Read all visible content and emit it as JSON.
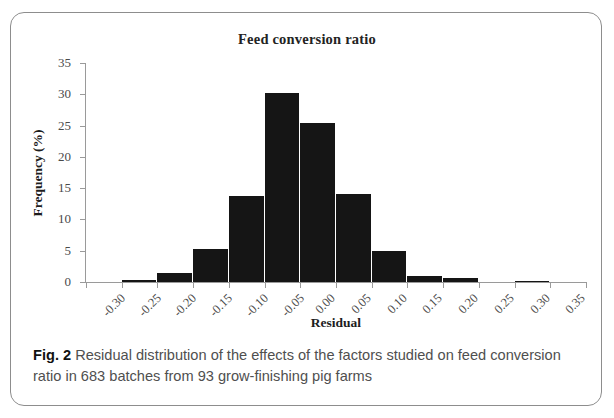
{
  "figure": {
    "label": "Fig. 2",
    "caption_text": " Residual distribution of the effects of the factors studied on feed conversion ratio in 683 batches from 93 grow-finishing pig farms"
  },
  "chart_data": {
    "type": "bar",
    "title": "Feed conversion ratio",
    "xlabel": "Residual",
    "ylabel": "Frequency (%)",
    "ylim": [
      0,
      35
    ],
    "ytick_labels": [
      "0",
      "5",
      "10",
      "15",
      "20",
      "25",
      "30",
      "35"
    ],
    "ytick_values": [
      0,
      5,
      10,
      15,
      20,
      25,
      30,
      35
    ],
    "xlim": [
      -0.3,
      0.4
    ],
    "xtick_labels": [
      "-0.30",
      "-0.25",
      "-0.20",
      "-0.15",
      "-0.10",
      "-0.05",
      "0.00",
      "0.05",
      "0.10",
      "0.15",
      "0.20",
      "0.25",
      "0.30",
      "0.35",
      "0.40"
    ],
    "xtick_values": [
      -0.3,
      -0.25,
      -0.2,
      -0.15,
      -0.1,
      -0.05,
      0.0,
      0.05,
      0.1,
      0.15,
      0.2,
      0.25,
      0.3,
      0.35,
      0.4
    ],
    "bin_width": 0.05,
    "grid": false,
    "legend": false,
    "bar_color": "#151515",
    "axis_color": "#9a9a9a",
    "bins": [
      {
        "left": -0.25,
        "right": -0.2,
        "center": -0.225,
        "value": 0.3
      },
      {
        "left": -0.2,
        "right": -0.15,
        "center": -0.175,
        "value": 1.5
      },
      {
        "left": -0.15,
        "right": -0.1,
        "center": -0.125,
        "value": 5.3
      },
      {
        "left": -0.1,
        "right": -0.05,
        "center": -0.075,
        "value": 13.7
      },
      {
        "left": -0.05,
        "right": 0.0,
        "center": -0.025,
        "value": 30.2
      },
      {
        "left": 0.0,
        "right": 0.05,
        "center": 0.025,
        "value": 25.4
      },
      {
        "left": 0.05,
        "right": 0.1,
        "center": 0.075,
        "value": 14.0
      },
      {
        "left": 0.1,
        "right": 0.15,
        "center": 0.125,
        "value": 5.0
      },
      {
        "left": 0.15,
        "right": 0.2,
        "center": 0.175,
        "value": 0.9
      },
      {
        "left": 0.2,
        "right": 0.25,
        "center": 0.225,
        "value": 0.7
      },
      {
        "left": 0.3,
        "right": 0.35,
        "center": 0.325,
        "value": 0.2
      }
    ],
    "categories": [
      "-0.225",
      "-0.175",
      "-0.125",
      "-0.075",
      "-0.025",
      "0.025",
      "0.075",
      "0.125",
      "0.175",
      "0.225",
      "0.325"
    ],
    "values": [
      0.3,
      1.5,
      5.3,
      13.7,
      30.2,
      25.4,
      14.0,
      5.0,
      0.9,
      0.7,
      0.2
    ]
  }
}
